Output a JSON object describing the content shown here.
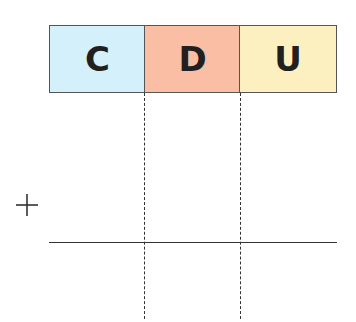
{
  "columns": [
    {
      "label": "C",
      "color": "#d4f0fa"
    },
    {
      "label": "D",
      "color": "#f9bea3"
    },
    {
      "label": "U",
      "color": "#fdf0c0"
    }
  ],
  "operator": "+"
}
